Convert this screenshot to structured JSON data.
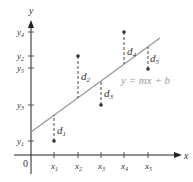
{
  "diagram": {
    "axes": {
      "x_label": "x",
      "y_label": "y",
      "origin_label": "0"
    },
    "x_ticks": [
      "x1",
      "x2",
      "x3",
      "x4",
      "x5"
    ],
    "y_ticks": [
      "y4",
      "y2",
      "y5",
      "y3",
      "y1"
    ],
    "line_equation": "y = mx + b",
    "deviations": [
      "d1",
      "d2",
      "d3",
      "d4",
      "d5"
    ],
    "colors": {
      "line": "#9a9a9a",
      "axis": "#222222",
      "points": "#333333"
    }
  }
}
